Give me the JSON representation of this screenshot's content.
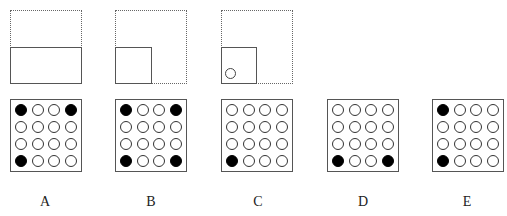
{
  "folding_steps": [
    {
      "step": 1,
      "description": "Square paper folded bottom half up (top half dashed, bottom half solid)"
    },
    {
      "step": 2,
      "description": "Folded again: right half folded left, leaving bottom-left quarter solid"
    },
    {
      "step": 3,
      "description": "One hole punched near bottom-left corner of the folded quarter",
      "hole": "circle"
    }
  ],
  "options": [
    {
      "label": "A",
      "grid": [
        [
          1,
          0,
          0,
          1
        ],
        [
          0,
          0,
          0,
          0
        ],
        [
          0,
          0,
          0,
          0
        ],
        [
          1,
          0,
          0,
          0
        ]
      ]
    },
    {
      "label": "B",
      "grid": [
        [
          1,
          0,
          0,
          1
        ],
        [
          0,
          0,
          0,
          0
        ],
        [
          0,
          0,
          0,
          0
        ],
        [
          1,
          0,
          0,
          1
        ]
      ]
    },
    {
      "label": "C",
      "grid": [
        [
          0,
          0,
          0,
          0
        ],
        [
          0,
          0,
          0,
          0
        ],
        [
          0,
          0,
          0,
          0
        ],
        [
          1,
          0,
          0,
          0
        ]
      ]
    },
    {
      "label": "D",
      "grid": [
        [
          0,
          0,
          0,
          0
        ],
        [
          0,
          0,
          0,
          0
        ],
        [
          0,
          0,
          0,
          0
        ],
        [
          1,
          0,
          0,
          1
        ]
      ]
    },
    {
      "label": "E",
      "grid": [
        [
          1,
          0,
          0,
          0
        ],
        [
          0,
          0,
          0,
          0
        ],
        [
          0,
          0,
          0,
          0
        ],
        [
          1,
          0,
          0,
          0
        ]
      ]
    }
  ],
  "colors": {
    "filled": "#000000",
    "empty": "#ffffff",
    "outline": "#555555"
  }
}
